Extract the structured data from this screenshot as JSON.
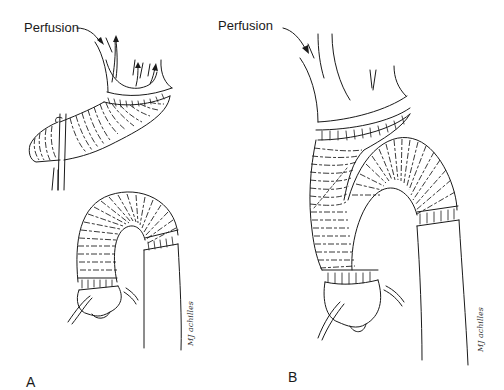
{
  "figure": {
    "panels": [
      {
        "id": "A",
        "letter": "A",
        "perfusion_label": "Perfusion",
        "signature": "MJ achilles"
      },
      {
        "id": "B",
        "letter": "B",
        "perfusion_label": "Perfusion",
        "signature": "MJ achilles"
      }
    ],
    "colors": {
      "line": "#1a1a1a",
      "background": "#ffffff"
    }
  }
}
